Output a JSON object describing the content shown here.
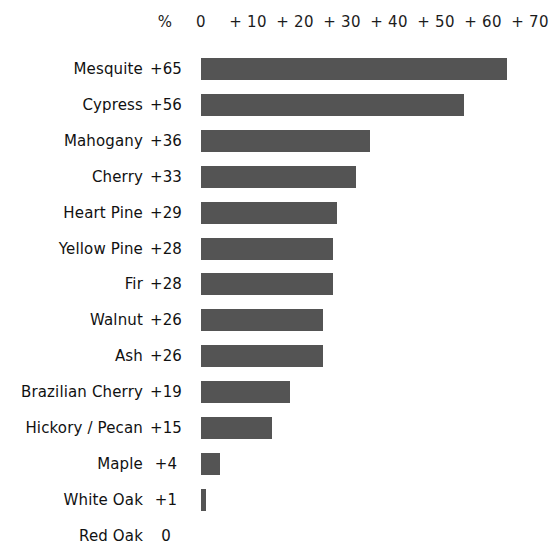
{
  "chart_data": {
    "type": "bar",
    "orientation": "horizontal",
    "title": "",
    "xlabel": "",
    "ylabel": "",
    "value_header": "%",
    "xlim": [
      0,
      70
    ],
    "grid": false,
    "legend": null,
    "bar_color": "#545454",
    "tick_labels": [
      "0",
      "+ 10",
      "+ 20",
      "+ 30",
      "+ 40",
      "+ 50",
      "+ 60",
      "+ 70"
    ],
    "ticks": [
      0,
      10,
      20,
      30,
      40,
      50,
      60,
      70
    ],
    "categories": [
      "Mesquite",
      "Cypress",
      "Mahogany",
      "Cherry",
      "Heart Pine",
      "Yellow Pine",
      "Fir",
      "Walnut",
      "Ash",
      "Brazilian Cherry",
      "Hickory / Pecan",
      "Maple",
      "White Oak",
      "Red Oak"
    ],
    "values": [
      65,
      56,
      36,
      33,
      29,
      28,
      28,
      26,
      26,
      19,
      15,
      4,
      1,
      0
    ],
    "value_labels": [
      "+65",
      "+56",
      "+36",
      "+33",
      "+29",
      "+28",
      "+28",
      "+26",
      "+26",
      "+19",
      "+15",
      "+4",
      "+1",
      "0"
    ]
  }
}
